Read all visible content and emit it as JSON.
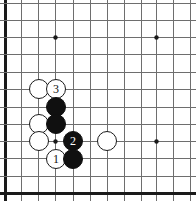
{
  "figure": {
    "name": "go-board-diagram",
    "type": "go-board",
    "width": 196,
    "height": 201,
    "background_color": "#ffffff",
    "line_color": "#6e6e6e",
    "border_color": "#1a1a1a",
    "black_color": "#101010",
    "white_color": "#ffffff",
    "grid_spacing": 17.3,
    "origin_x": 5,
    "origin_y": 37,
    "edges": {
      "left_border": true,
      "bottom_border": true,
      "top_border": false,
      "right_border": false
    },
    "vertical_lines_x": [
      5,
      21,
      38,
      55,
      73,
      90,
      107,
      124,
      141,
      156,
      173,
      190
    ],
    "horizontal_lines_y": [
      3,
      20,
      37,
      54,
      72,
      89,
      107,
      124,
      141,
      158,
      176,
      193
    ],
    "star_points": [
      {
        "name": "star-point-upper-left",
        "x": 55,
        "y": 37
      },
      {
        "name": "star-point-upper-right",
        "x": 156,
        "y": 37
      },
      {
        "name": "star-point-lower-left",
        "x": 55,
        "y": 141
      },
      {
        "name": "star-point-lower-right",
        "x": 156,
        "y": 141
      }
    ]
  },
  "stones": [
    {
      "id": "white-stone-a",
      "color": "white",
      "label": "",
      "x": 39,
      "y": 89,
      "r": 10
    },
    {
      "id": "white-stone-move-3",
      "color": "white",
      "label": "3",
      "x": 56,
      "y": 89,
      "r": 10
    },
    {
      "id": "black-stone-b",
      "color": "black",
      "label": "",
      "x": 56,
      "y": 107,
      "r": 10
    },
    {
      "id": "white-stone-c",
      "color": "white",
      "label": "",
      "x": 39,
      "y": 124,
      "r": 10
    },
    {
      "id": "black-stone-d",
      "color": "black",
      "label": "",
      "x": 56,
      "y": 124,
      "r": 10
    },
    {
      "id": "white-stone-e",
      "color": "white",
      "label": "",
      "x": 39,
      "y": 141,
      "r": 10
    },
    {
      "id": "black-stone-move-2",
      "color": "black",
      "label": "2",
      "x": 73,
      "y": 141,
      "r": 10
    },
    {
      "id": "white-stone-f",
      "color": "white",
      "label": "",
      "x": 107,
      "y": 141,
      "r": 10
    },
    {
      "id": "white-stone-move-1",
      "color": "white",
      "label": "1",
      "x": 56,
      "y": 159,
      "r": 10
    },
    {
      "id": "black-stone-g",
      "color": "black",
      "label": "",
      "x": 73,
      "y": 159,
      "r": 10
    }
  ],
  "move_sequence": [
    {
      "number": "1",
      "color": "white"
    },
    {
      "number": "2",
      "color": "black"
    },
    {
      "number": "3",
      "color": "white"
    }
  ]
}
